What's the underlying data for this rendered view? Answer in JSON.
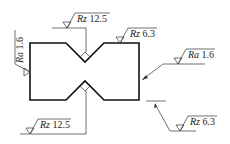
{
  "diagram": {
    "type": "engineering-drawing",
    "colors": {
      "outline": "#111111",
      "thin": "#333333",
      "background": "#ffffff"
    },
    "annotations": [
      {
        "id": "top-notch",
        "param": "Rz",
        "value": "12.5"
      },
      {
        "id": "top-right-face",
        "param": "Rz",
        "value": "6.3"
      },
      {
        "id": "right-face",
        "param": "Ra",
        "value": "1.6"
      },
      {
        "id": "left-face",
        "param": "Ra",
        "value": "1.6"
      },
      {
        "id": "bottom-notch",
        "param": "Rz",
        "value": "12.5"
      },
      {
        "id": "bottom-right-face",
        "param": "Rz",
        "value": "6.3"
      }
    ]
  }
}
